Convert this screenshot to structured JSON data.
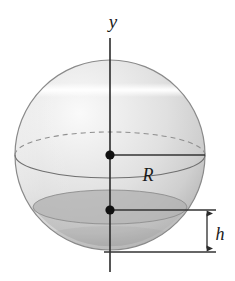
{
  "figure": {
    "canvas": {
      "width": 235,
      "height": 281,
      "background": "#ffffff"
    },
    "labels": {
      "axis_y": "y",
      "radius_R": "R",
      "height_h": "h"
    },
    "colors": {
      "outline": "#8a8a8a",
      "line": "#3a3a3a",
      "axis": "#2b2b2b",
      "dot": "#111111",
      "sphere_light": "#f2f2f2",
      "sphere_mid": "#dcdcdc",
      "sphere_dark": "#b6b6b6",
      "cap_fill": "#b9b9b9",
      "highlight": "#fbfbfb",
      "dash": "#9a9a9a"
    },
    "geometry": {
      "sphere_center_x": 110,
      "sphere_center_y": 155,
      "sphere_radius": 95,
      "equator_y": 155,
      "equator_ry": 23,
      "cap_plane_y": 207,
      "cap_ry": 17,
      "cap_half_width": 77,
      "axis_top_y": 38,
      "axis_bottom_y": 272,
      "dot_center": [
        110,
        155
      ],
      "dot_cap": [
        110,
        210
      ],
      "radius_line_end_x": 205,
      "dim_line_x": 207,
      "dim_top_y": 210,
      "dim_bottom_y": 252,
      "baseline_y": 252,
      "baseline_x1": 104,
      "baseline_x2": 216,
      "cap_leader_x2": 216,
      "highlight_band_y": 90
    },
    "label_positions": {
      "axis_y": [
        113,
        28
      ],
      "radius_R": [
        140,
        181
      ],
      "height_h": [
        216,
        240
      ]
    }
  }
}
